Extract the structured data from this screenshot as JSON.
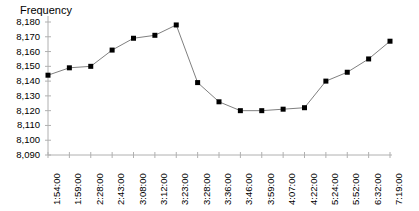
{
  "chart_data": {
    "type": "line",
    "title": "",
    "ylabel": "Frequency",
    "xlabel": "",
    "ylim": [
      8090,
      8180
    ],
    "ytick_step": 10,
    "yticks": [
      "8,180",
      "8,170",
      "8,160",
      "8,150",
      "8,140",
      "8,130",
      "8,120",
      "8,110",
      "8,100",
      "8,090"
    ],
    "ytick_values": [
      8180,
      8170,
      8160,
      8150,
      8140,
      8130,
      8120,
      8110,
      8100,
      8090
    ],
    "grid": false,
    "legend": "none",
    "marker": "square",
    "marker_color": "#000000",
    "line_color": "#808080",
    "categories": [
      "1:54:00",
      "1:59:00",
      "2:28:00",
      "2:43:00",
      "3:08:00",
      "3:12:00",
      "3:23:00",
      "3:28:00",
      "3:36:00",
      "3:46:00",
      "3:59:00",
      "4:07:00",
      "4:22:00",
      "5:24:00",
      "5:52:00",
      "6:32:00",
      "7:19:00"
    ],
    "values": [
      8144,
      8149,
      8150,
      8161,
      8169,
      8171,
      8178,
      8139,
      8126,
      8120,
      8120,
      8121,
      8122,
      8140,
      8146,
      8155,
      8167
    ]
  }
}
